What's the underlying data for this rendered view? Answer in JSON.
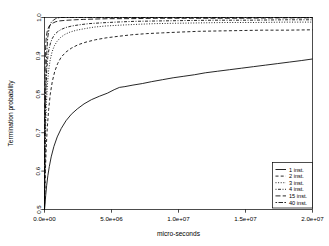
{
  "chart_data": {
    "type": "line",
    "title": "",
    "xlabel": "micro-seconds",
    "ylabel": "Termination probability",
    "xlim": [
      0,
      20000000
    ],
    "ylim": [
      0.5,
      1.0
    ],
    "grid": false,
    "legend_position": "bottom-right",
    "xticks": [
      0,
      5000000,
      10000000,
      15000000,
      20000000
    ],
    "xtick_labels": [
      "0.0e+00",
      "5.0e+06",
      "1.0e+07",
      "1.5e+07",
      "2.0e+07"
    ],
    "yticks": [
      0.5,
      0.6,
      0.7,
      0.8,
      0.9,
      1.0
    ],
    "ytick_labels": [
      "0.5",
      "0.6",
      "0.7",
      "0.8",
      "0.9",
      "1.0"
    ],
    "series": [
      {
        "name": "1 inst.",
        "linestyle": "solid",
        "dasharray": "none",
        "x": [
          0,
          40000,
          90000,
          160000,
          250000,
          360000,
          500000,
          700000,
          950000,
          1250000,
          1600000,
          2000000,
          2450000,
          2950000,
          3500000,
          4100000,
          4700000,
          5200000,
          5600000,
          6000000,
          6600000,
          7300000,
          8000000,
          8800000,
          9600000,
          10400000,
          11200000,
          12000000,
          12900000,
          13800000,
          14700000,
          15600000,
          16500000,
          17400000,
          18300000,
          19200000,
          20000000
        ],
        "y": [
          0.498,
          0.515,
          0.537,
          0.562,
          0.588,
          0.612,
          0.637,
          0.664,
          0.689,
          0.711,
          0.731,
          0.748,
          0.762,
          0.775,
          0.786,
          0.795,
          0.803,
          0.812,
          0.818,
          0.82,
          0.824,
          0.828,
          0.833,
          0.838,
          0.843,
          0.847,
          0.851,
          0.856,
          0.86,
          0.864,
          0.868,
          0.872,
          0.876,
          0.88,
          0.884,
          0.888,
          0.892
        ]
      },
      {
        "name": "2 inst.",
        "linestyle": "dashed",
        "dasharray": "3,2.2",
        "x": [
          0,
          30000,
          70000,
          130000,
          210000,
          310000,
          430000,
          580000,
          760000,
          980000,
          1250000,
          1600000,
          2000000,
          2500000,
          3100000,
          3800000,
          4600000,
          5500000,
          6500000,
          7600000,
          8800000,
          10100000,
          11500000,
          13000000,
          14600000,
          16300000,
          18100000,
          20000000
        ],
        "y": [
          0.5,
          0.548,
          0.605,
          0.662,
          0.714,
          0.76,
          0.8,
          0.833,
          0.859,
          0.88,
          0.897,
          0.91,
          0.92,
          0.929,
          0.936,
          0.942,
          0.947,
          0.951,
          0.955,
          0.958,
          0.96,
          0.962,
          0.964,
          0.965,
          0.966,
          0.967,
          0.967,
          0.968
        ]
      },
      {
        "name": "3 inst.",
        "linestyle": "dotted",
        "dasharray": "1,1.6",
        "x": [
          0,
          25000,
          55000,
          95000,
          150000,
          220000,
          310000,
          420000,
          560000,
          730000,
          940000,
          1200000,
          1520000,
          1900000,
          2400000,
          3000000,
          3700000,
          4600000,
          5600000,
          6800000,
          8200000,
          9800000,
          11600000,
          13600000,
          15800000,
          18000000,
          20000000
        ],
        "y": [
          0.501,
          0.576,
          0.653,
          0.722,
          0.78,
          0.826,
          0.862,
          0.889,
          0.91,
          0.926,
          0.938,
          0.948,
          0.956,
          0.962,
          0.967,
          0.971,
          0.975,
          0.978,
          0.98,
          0.982,
          0.984,
          0.985,
          0.986,
          0.987,
          0.987,
          0.988,
          0.988
        ]
      },
      {
        "name": "4 inst.",
        "linestyle": "dotdash",
        "dasharray": "1,1.5,3,1.5",
        "x": [
          0,
          20000,
          45000,
          78000,
          120000,
          175000,
          245000,
          335000,
          450000,
          590000,
          760000,
          980000,
          1250000,
          1600000,
          2050000,
          2600000,
          3300000,
          4200000,
          5300000,
          6700000,
          8400000,
          10400000,
          12700000,
          15300000,
          18000000,
          20000000
        ],
        "y": [
          0.502,
          0.608,
          0.7,
          0.772,
          0.826,
          0.866,
          0.896,
          0.918,
          0.934,
          0.946,
          0.956,
          0.963,
          0.969,
          0.974,
          0.978,
          0.981,
          0.984,
          0.986,
          0.988,
          0.99,
          0.991,
          0.992,
          0.993,
          0.993,
          0.994,
          0.994
        ]
      },
      {
        "name": "15 inst.",
        "linestyle": "longdash",
        "dasharray": "5,2.2",
        "x": [
          0,
          12000,
          28000,
          48000,
          74000,
          108000,
          152000,
          210000,
          285000,
          380000,
          500000,
          650000,
          840000,
          1080000,
          1380000,
          1760000,
          2250000,
          2900000,
          3750000,
          4900000,
          6400000,
          8400000,
          11000000,
          14500000,
          18000000,
          20000000
        ],
        "y": [
          0.503,
          0.7,
          0.81,
          0.875,
          0.914,
          0.938,
          0.954,
          0.965,
          0.973,
          0.979,
          0.983,
          0.986,
          0.989,
          0.991,
          0.992,
          0.993,
          0.994,
          0.995,
          0.996,
          0.997,
          0.997,
          0.998,
          0.998,
          0.998,
          0.999,
          0.999
        ]
      },
      {
        "name": "40 inst.",
        "linestyle": "twodash",
        "dasharray": "1.6,1.4,4.5,1.4",
        "x": [
          0,
          60000,
          140000,
          240000,
          360000,
          500000,
          660000,
          840000,
          1000000,
          1200000,
          1500000,
          2000000,
          3000000,
          4500000,
          6500000,
          9000000,
          12000000,
          15500000,
          18000000,
          20000000
        ],
        "y": [
          0.5,
          0.76,
          0.89,
          0.948,
          0.975,
          0.987,
          0.993,
          0.997,
          0.999,
          1.0,
          1.0,
          1.0,
          1.0,
          1.0,
          1.0,
          1.0,
          1.0,
          1.0,
          1.0,
          1.0
        ]
      }
    ]
  },
  "legend": {
    "entries": [
      "1 inst.",
      "2 inst.",
      "3 inst.",
      "4 inst.",
      "15 inst.",
      "40 inst."
    ]
  },
  "axes": {
    "x_title": "micro-seconds",
    "y_title": "Termination probability",
    "x_tick_labels": [
      "0.0e+00",
      "5.0e+06",
      "1.0e+07",
      "1.5e+07",
      "2.0e+07"
    ],
    "y_tick_labels": [
      "1.0",
      "0.9",
      "0.8",
      "0.7",
      "0.6",
      "0.5"
    ]
  },
  "colors": {
    "foreground": "#000000",
    "background": "#ffffff"
  }
}
